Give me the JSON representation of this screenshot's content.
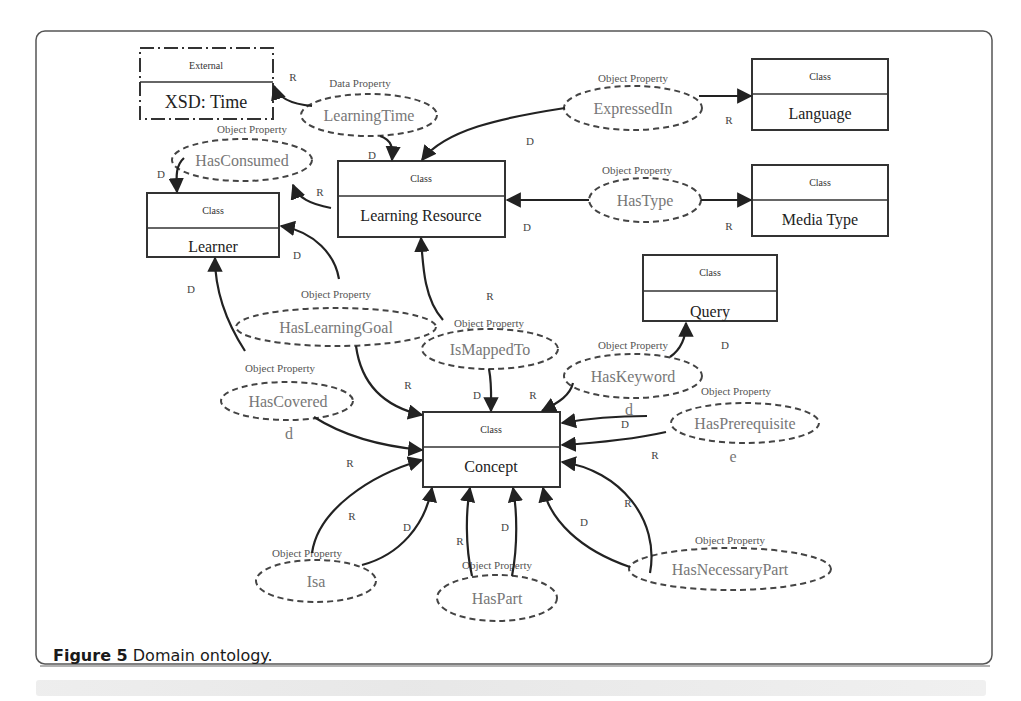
{
  "figure": {
    "caption_label": "Figure 5",
    "caption_text": " Domain ontology."
  },
  "classes": [
    {
      "id": "xsd_time",
      "stereotype": "External",
      "name": "XSD: Time",
      "style": "dash-dot"
    },
    {
      "id": "learner",
      "stereotype": "Class",
      "name": "Learner"
    },
    {
      "id": "learning_resource",
      "stereotype": "Class",
      "name": "Learning Resource"
    },
    {
      "id": "language",
      "stereotype": "Class",
      "name": "Language"
    },
    {
      "id": "media_type",
      "stereotype": "Class",
      "name": "Media Type"
    },
    {
      "id": "query",
      "stereotype": "Class",
      "name": "Query"
    },
    {
      "id": "concept",
      "stereotype": "Class",
      "name": "Concept"
    }
  ],
  "properties": [
    {
      "id": "learning_time",
      "kind": "Data Property",
      "name": "LearningTime",
      "domain": "Learning Resource",
      "range": "XSD: Time"
    },
    {
      "id": "has_consumed",
      "kind": "Object Property",
      "name": "HasConsumed",
      "domain": "Learner",
      "range": "Learning Resource"
    },
    {
      "id": "expressed_in",
      "kind": "Object Property",
      "name": "ExpressedIn",
      "domain": "Learning Resource",
      "range": "Language"
    },
    {
      "id": "has_type",
      "kind": "Object Property",
      "name": "HasType",
      "domain": "Learning Resource",
      "range": "Media Type"
    },
    {
      "id": "has_learning_goal",
      "kind": "Object Property",
      "name": "HasLearningGoal",
      "domain": "Learner",
      "range": "Concept"
    },
    {
      "id": "is_mapped_to",
      "kind": "Object Property",
      "name": "IsMappedTo",
      "domain": "Concept",
      "range": "Learning Resource"
    },
    {
      "id": "has_keyword",
      "kind": "Object Property",
      "name": "HasKeyword",
      "domain": "Query",
      "range": "Concept"
    },
    {
      "id": "has_covered",
      "kind": "Object Property",
      "name": "HasCovered",
      "domain": "Learner",
      "range": "Concept"
    },
    {
      "id": "has_prerequisite",
      "kind": "Object Property",
      "name": "HasPrerequisite",
      "domain": "Concept",
      "range": "Concept"
    },
    {
      "id": "isa",
      "kind": "Object Property",
      "name": "Isa",
      "domain": "Concept",
      "range": "Concept"
    },
    {
      "id": "has_part",
      "kind": "Object Property",
      "name": "HasPart",
      "domain": "Concept",
      "range": "Concept"
    },
    {
      "id": "has_necessary_part",
      "kind": "Object Property",
      "name": "HasNecessaryPart",
      "domain": "Concept",
      "range": "Concept"
    }
  ],
  "edge_labels": {
    "domain": "D",
    "range": "R",
    "stray_d": "d",
    "stray_e": "e"
  }
}
